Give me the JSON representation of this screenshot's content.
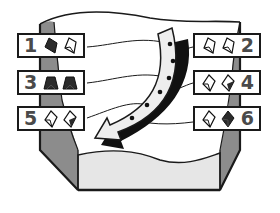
{
  "diagram": {
    "type": "stacking-order illustration",
    "colors": {
      "outline": "#1a1a1a",
      "column_fill": "#8c8c8c",
      "arrow_fill": "#eeeeee",
      "container_fill": "#e6e6e6",
      "tile_dark": "#2b2b2b",
      "number": "#4a4a4a"
    },
    "labels": [
      {
        "number": "1",
        "side": "left",
        "icons": [
          "dark-tile-icon",
          "light-tile-icon"
        ]
      },
      {
        "number": "2",
        "side": "right",
        "icons": [
          "light-tile-icon",
          "light-tile-icon"
        ]
      },
      {
        "number": "3",
        "side": "left",
        "icons": [
          "dark-trapezoid-icon",
          "dark-trapezoid-icon"
        ]
      },
      {
        "number": "4",
        "side": "right",
        "icons": [
          "light-tile-icon",
          "half-dark-tile-icon"
        ]
      },
      {
        "number": "5",
        "side": "left",
        "icons": [
          "light-tile-icon",
          "half-dark-tile-icon"
        ]
      },
      {
        "number": "6",
        "side": "right",
        "icons": [
          "light-tile-icon",
          "dark-tile-icon"
        ]
      }
    ],
    "arrow": {
      "direction": "curved, top-right to bottom-left",
      "connection_dots": 6
    }
  }
}
